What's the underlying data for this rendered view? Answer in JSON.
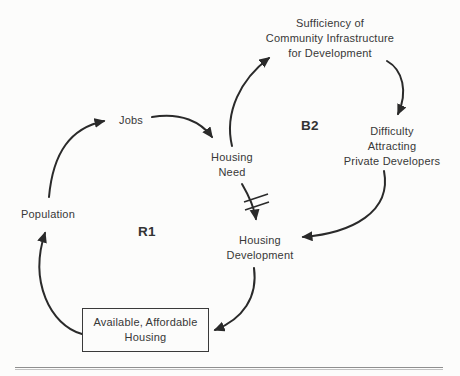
{
  "page": {
    "background_color": "#fcfcfb",
    "text_color": "#383838",
    "arrow_color": "#2a2a2a",
    "rule_color": "#8f8f8f"
  },
  "diagram": {
    "type": "causal-loop-diagram",
    "nodes": {
      "sufficiency": {
        "label": "Sufficiency of\nCommunity Infrastructure\nfor Development"
      },
      "difficulty": {
        "label": "Difficulty\nAttracting\nPrivate Developers"
      },
      "jobs": {
        "label": "Jobs"
      },
      "housing_need": {
        "label": "Housing\nNeed"
      },
      "population": {
        "label": "Population"
      },
      "housing_development": {
        "label": "Housing\nDevelopment"
      },
      "available_housing": {
        "label": "Available, Affordable\nHousing"
      }
    },
    "loop_labels": {
      "r1": "R1",
      "b2": "B2"
    },
    "edges": [
      {
        "from": "Population",
        "to": "Jobs",
        "delay": false
      },
      {
        "from": "Jobs",
        "to": "Housing Need",
        "delay": false
      },
      {
        "from": "Housing Need",
        "to": "Housing Development",
        "delay": true
      },
      {
        "from": "Housing Development",
        "to": "Available, Affordable Housing",
        "delay": false
      },
      {
        "from": "Available, Affordable Housing",
        "to": "Population",
        "delay": false
      },
      {
        "from": "Housing Need",
        "to": "Sufficiency of Community Infrastructure for Development",
        "delay": false
      },
      {
        "from": "Sufficiency of Community Infrastructure for Development",
        "to": "Difficulty Attracting Private Developers",
        "delay": false
      },
      {
        "from": "Difficulty Attracting Private Developers",
        "to": "Housing Development",
        "delay": false
      }
    ]
  }
}
